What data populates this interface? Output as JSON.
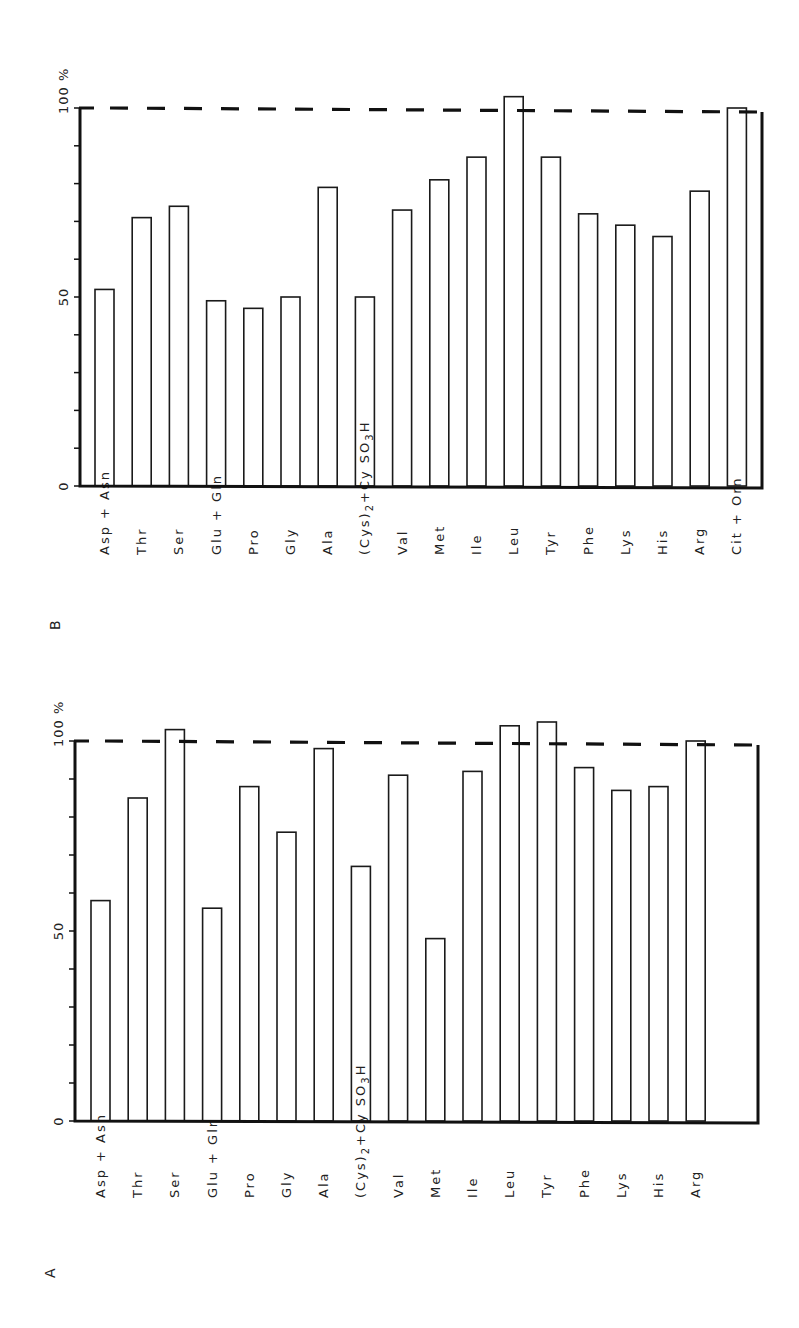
{
  "figure": {
    "panels": [
      {
        "id": "B",
        "panel_label": "B",
        "y_tick_labels": [
          "0",
          "50",
          "100 %"
        ],
        "reference_line_label": "100 %"
      },
      {
        "id": "A",
        "panel_label": "A",
        "y_tick_labels": [
          "0",
          "50",
          "100 %"
        ],
        "reference_line_label": "100 %"
      }
    ]
  },
  "chart_data": [
    {
      "type": "bar",
      "title": "B",
      "xlabel": "",
      "ylabel": "%",
      "ylim": [
        0,
        100
      ],
      "yticks": [
        0,
        50,
        100
      ],
      "ytick_labels": [
        "0",
        "50",
        "100 %"
      ],
      "minor_tick_step": 10,
      "reference_line": {
        "y": 100,
        "style": "dashed"
      },
      "grid": false,
      "orientation": "rotated 90° (page landscape)",
      "categories": [
        "Asp + Asn",
        "Thr",
        "Ser",
        "Glu + Gln",
        "Pro",
        "Gly",
        "Ala",
        "(Cys)2 + Cy SO3H",
        "Val",
        "Met",
        "Ile",
        "Leu",
        "Tyr",
        "Phe",
        "Lys",
        "His",
        "Arg",
        "Cit + Orn"
      ],
      "values": [
        52,
        71,
        74,
        49,
        47,
        50,
        79,
        50,
        73,
        81,
        87,
        103,
        87,
        72,
        69,
        66,
        78,
        100
      ]
    },
    {
      "type": "bar",
      "title": "A",
      "xlabel": "",
      "ylabel": "%",
      "ylim": [
        0,
        100
      ],
      "yticks": [
        0,
        50,
        100
      ],
      "ytick_labels": [
        "0",
        "50",
        "100 %"
      ],
      "minor_tick_step": 10,
      "reference_line": {
        "y": 100,
        "style": "dashed"
      },
      "grid": false,
      "orientation": "rotated 90° (page landscape)",
      "categories": [
        "Asp + Asn",
        "Thr",
        "Ser",
        "Glu + Gln",
        "Pro",
        "Gly",
        "Ala",
        "(Cys)2 + Cy SO3H",
        "Val",
        "Met",
        "Ile",
        "Leu",
        "Tyr",
        "Phe",
        "Lys",
        "His",
        "Arg"
      ],
      "values": [
        58,
        85,
        103,
        56,
        88,
        76,
        98,
        67,
        91,
        48,
        92,
        104,
        105,
        93,
        87,
        88,
        100
      ]
    }
  ],
  "layout": {
    "B": {
      "x0": 80,
      "x_end": 762,
      "y0": 486,
      "y100": 108,
      "first_bar_x": 95,
      "pitch": 37.2,
      "bar_w": 19,
      "label_x_offset": 10,
      "label_y": 555,
      "panel_label_x": 60,
      "panel_label_y": 630
    },
    "A": {
      "x0": 75,
      "x_end": 758,
      "y0": 1121,
      "y100": 741,
      "first_bar_x": 91,
      "pitch": 37.2,
      "bar_w": 19,
      "label_x_offset": 10,
      "label_y": 1198,
      "panel_label_x": 55,
      "panel_label_y": 1278
    }
  }
}
